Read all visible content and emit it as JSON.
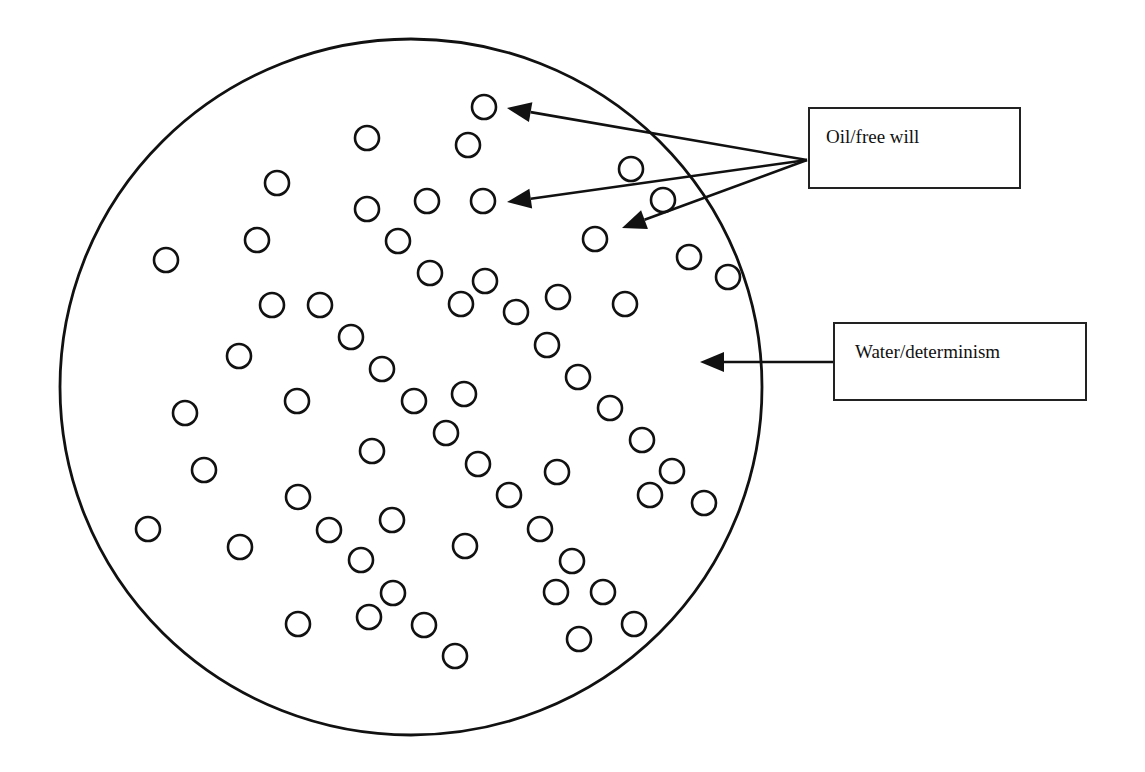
{
  "diagram": {
    "title": "",
    "container": {
      "label": "Water/determinism",
      "cx": 411,
      "cy": 387,
      "rx": 351,
      "ry": 348
    },
    "particles_label": "Oil/free will",
    "particles": [
      [
        484,
        107
      ],
      [
        367,
        138
      ],
      [
        468,
        145
      ],
      [
        631,
        169
      ],
      [
        277,
        183
      ],
      [
        367,
        209
      ],
      [
        427,
        201
      ],
      [
        483,
        201
      ],
      [
        663,
        200
      ],
      [
        257,
        240
      ],
      [
        398,
        241
      ],
      [
        595,
        239
      ],
      [
        166,
        260
      ],
      [
        689,
        257
      ],
      [
        430,
        273
      ],
      [
        485,
        281
      ],
      [
        728,
        277
      ],
      [
        272,
        305
      ],
      [
        320,
        305
      ],
      [
        461,
        304
      ],
      [
        558,
        297
      ],
      [
        625,
        304
      ],
      [
        516,
        312
      ],
      [
        351,
        337
      ],
      [
        547,
        345
      ],
      [
        239,
        356
      ],
      [
        382,
        369
      ],
      [
        578,
        377
      ],
      [
        185,
        413
      ],
      [
        297,
        401
      ],
      [
        414,
        401
      ],
      [
        464,
        394
      ],
      [
        610,
        408
      ],
      [
        446,
        433
      ],
      [
        642,
        440
      ],
      [
        372,
        451
      ],
      [
        478,
        464
      ],
      [
        204,
        470
      ],
      [
        557,
        472
      ],
      [
        672,
        471
      ],
      [
        298,
        497
      ],
      [
        509,
        495
      ],
      [
        650,
        495
      ],
      [
        704,
        503
      ],
      [
        148,
        529
      ],
      [
        329,
        530
      ],
      [
        392,
        520
      ],
      [
        540,
        529
      ],
      [
        240,
        547
      ],
      [
        465,
        546
      ],
      [
        361,
        560
      ],
      [
        572,
        561
      ],
      [
        393,
        593
      ],
      [
        556,
        592
      ],
      [
        603,
        592
      ],
      [
        298,
        624
      ],
      [
        369,
        617
      ],
      [
        424,
        625
      ],
      [
        634,
        624
      ],
      [
        579,
        639
      ],
      [
        455,
        656
      ]
    ],
    "particle_radius": 12
  },
  "labels": {
    "oil": {
      "text": "Oil/free will",
      "box": {
        "x": 808,
        "y": 107,
        "w": 213,
        "h": 82
      },
      "text_pos": {
        "x": 826,
        "y": 126
      }
    },
    "water": {
      "text": "Water/determinism",
      "box": {
        "x": 833,
        "y": 322,
        "w": 254,
        "h": 79
      },
      "text_pos": {
        "x": 855,
        "y": 341
      }
    }
  },
  "arrows": [
    {
      "from": [
        807,
        160
      ],
      "to": [
        507,
        108
      ],
      "target": "oil-particle"
    },
    {
      "from": [
        807,
        160
      ],
      "to": [
        507,
        202
      ],
      "target": "oil-particle"
    },
    {
      "from": [
        807,
        160
      ],
      "to": [
        622,
        228
      ],
      "target": "oil-particle"
    },
    {
      "from": [
        833,
        362
      ],
      "to": [
        700,
        362
      ],
      "target": "water"
    }
  ],
  "colors": {
    "stroke": "#111111",
    "background": "#ffffff"
  }
}
